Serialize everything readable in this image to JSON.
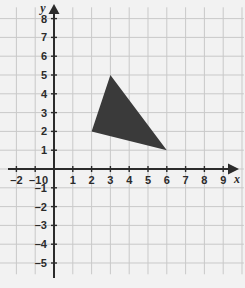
{
  "chart_data": {
    "type": "scatter",
    "title": "",
    "xlabel": "x",
    "ylabel": "y",
    "xlim": [
      -2.9,
      10.1
    ],
    "ylim": [
      -5.6,
      8.6
    ],
    "grid": true,
    "legend_position": "none",
    "x_ticks": [
      "-2",
      "-1",
      "0",
      "1",
      "2",
      "3",
      "4",
      "5",
      "6",
      "7",
      "8",
      "9"
    ],
    "x_tick_values": [
      -2,
      -1,
      0,
      1,
      2,
      3,
      4,
      5,
      6,
      7,
      8,
      9
    ],
    "y_ticks": [
      "8",
      "7",
      "6",
      "5",
      "4",
      "3",
      "2",
      "1",
      "0",
      "-1",
      "-2",
      "-3",
      "-4",
      "-5"
    ],
    "y_tick_values": [
      8,
      7,
      6,
      5,
      4,
      3,
      2,
      1,
      0,
      -1,
      -2,
      -3,
      -4,
      -5
    ],
    "origin_label": "0",
    "series": [
      {
        "name": "triangle",
        "type": "polygon",
        "fill": "#3a3a3a",
        "points": [
          {
            "x": 3,
            "y": 5
          },
          {
            "x": 2,
            "y": 2
          },
          {
            "x": 6,
            "y": 1
          }
        ]
      }
    ]
  },
  "colors": {
    "background": "#f2f2f2",
    "grid": "#c9c9c9",
    "axis": "#2b2b2b",
    "shape_fill": "#3a3a3a",
    "label": "#2b2b2b"
  },
  "axes": {
    "x_axis_name": "x",
    "y_axis_name": "y"
  }
}
